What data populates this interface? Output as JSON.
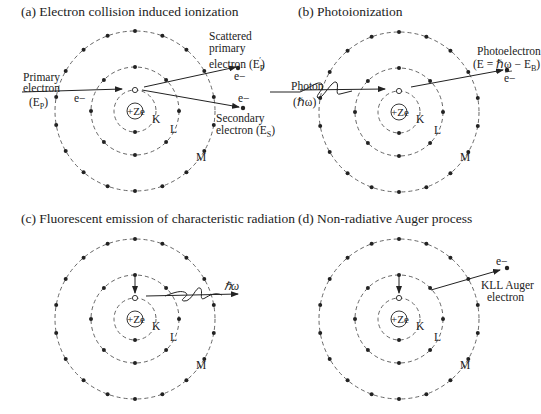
{
  "figure": {
    "panels": [
      {
        "id": "a",
        "title": "(a) Electron collision induced ionization",
        "center": [
          135,
          111
        ],
        "labels": {
          "primary_1": "Primary",
          "primary_2": "electron",
          "primary_3": "(E",
          "primary_sub": "P",
          "primary_close": ")",
          "e_in": "e−",
          "scattered_1": "Scattered",
          "scattered_2": "primary",
          "scattered_3": "electron (E",
          "scattered_sub": "P",
          "scattered_sup": "′",
          "scattered_close": ")",
          "e_scattered": "e−",
          "e_secondary": "e−",
          "secondary_1": "Secondary",
          "secondary_2": "electron (E",
          "secondary_sub": "S",
          "secondary_close": ")",
          "nucleus": "+Ze",
          "shell_k": "K",
          "shell_l": "L",
          "shell_m": "M"
        }
      },
      {
        "id": "b",
        "title": "(b) Photoionization",
        "center": [
          399,
          112
        ],
        "labels": {
          "photon_1": "Photon",
          "photon_2": "(ℏω)",
          "photoelectron_1": "Photoelectron",
          "photoelectron_2": "(E = ℏω − E",
          "photoelectron_sub": "B",
          "photoelectron_close": ")",
          "e_out": "e−",
          "nucleus": "+Ze",
          "shell_k": "K",
          "shell_l": "L",
          "shell_m": "M"
        }
      },
      {
        "id": "c",
        "title": "(c) Fluorescent emission of characteristic radiation",
        "center": [
          135,
          319
        ],
        "labels": {
          "photon_out": "ℏω",
          "nucleus": "+Ze",
          "shell_k": "K",
          "shell_l": "L",
          "shell_m": "M"
        }
      },
      {
        "id": "d",
        "title": "(d) Non-radiative Auger process",
        "center": [
          399,
          319
        ],
        "labels": {
          "e_out": "e−",
          "auger_1": "KLL Auger",
          "auger_2": "electron",
          "nucleus": "+Ze",
          "shell_k": "K",
          "shell_l": "L",
          "shell_m": "M"
        }
      }
    ],
    "shells": {
      "k_radius": 21,
      "l_radius": 44,
      "m_radius": 80,
      "k_dots": 2,
      "l_dots": 8,
      "m_dots": 18
    },
    "colors": {
      "ink": "#222222",
      "dash": "#555555",
      "background": "#ffffff"
    }
  }
}
